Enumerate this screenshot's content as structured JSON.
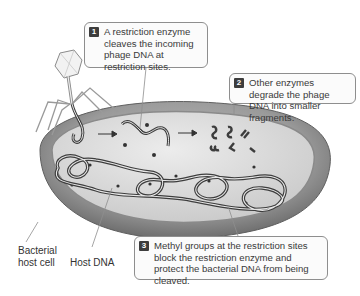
{
  "figure": {
    "type": "diagram"
  },
  "callouts": [
    {
      "step": "1",
      "text": "A restriction enzyme cleaves the incoming phage DNA at restriction sites."
    },
    {
      "step": "2",
      "text": "Other enzymes degrade the phage DNA into smaller fragments."
    },
    {
      "step": "3",
      "text": "Methyl groups at the restriction sites block the restriction enzyme and protect the bacterial DNA from being cleaved."
    }
  ],
  "labels": {
    "bacterial_host_cell": "Bacterial host cell",
    "host_dna": "Host DNA"
  },
  "colors": {
    "cell_outer": "#7a7a7a",
    "cell_inner": "#d6d6d6",
    "dna": "#3d3d3d",
    "callout_border": "#8e8e8e",
    "step_badge": "#3d3d3d"
  }
}
